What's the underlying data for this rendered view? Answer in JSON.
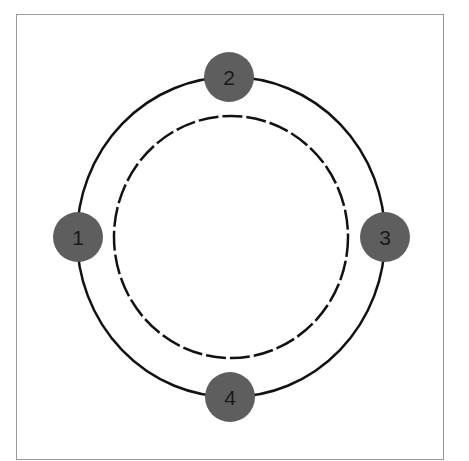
{
  "diagram": {
    "type": "cycle",
    "colors": {
      "node_fill": "#5e5e5e",
      "node_text": "#1a1a1a",
      "line": "#111111",
      "frame": "#9a9a9a",
      "background": "#ffffff"
    },
    "outer_ring": {
      "style": "solid",
      "cx": 231,
      "cy": 237,
      "rx": 154,
      "ry": 160
    },
    "inner_ring": {
      "style": "dashed",
      "cx": 231,
      "cy": 237,
      "rx": 117,
      "ry": 121
    },
    "nodes": [
      {
        "id": "1",
        "label": "1",
        "position": "left",
        "cx": 78,
        "cy": 237
      },
      {
        "id": "2",
        "label": "2",
        "position": "top",
        "cx": 229,
        "cy": 77
      },
      {
        "id": "3",
        "label": "3",
        "position": "right",
        "cx": 385,
        "cy": 237
      },
      {
        "id": "4",
        "label": "4",
        "position": "bottom",
        "cx": 230,
        "cy": 397
      }
    ]
  }
}
